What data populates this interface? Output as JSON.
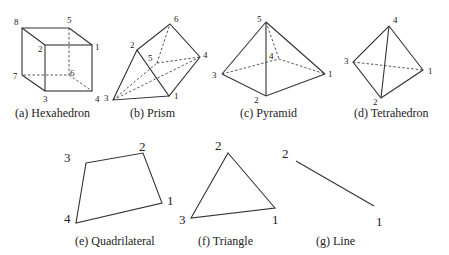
{
  "figures": [
    {
      "id": "hexahedron",
      "caption": "(a) Hexahedron",
      "node_labels": [
        "1",
        "2",
        "3",
        "4",
        "5",
        "6",
        "7",
        "8"
      ]
    },
    {
      "id": "prism",
      "caption": "(b) Prism",
      "node_labels": [
        "1",
        "2",
        "3",
        "4",
        "5",
        "6"
      ]
    },
    {
      "id": "pyramid",
      "caption": "(c) Pyramid",
      "node_labels": [
        "1",
        "2",
        "3",
        "4",
        "5"
      ]
    },
    {
      "id": "tetrahedron",
      "caption": "(d) Tetrahedron",
      "node_labels": [
        "1",
        "2",
        "3",
        "4"
      ]
    },
    {
      "id": "quadrilateral",
      "caption": "(e) Quadrilateral",
      "node_labels": [
        "1",
        "2",
        "3",
        "4"
      ]
    },
    {
      "id": "triangle",
      "caption": "(f) Triangle",
      "node_labels": [
        "1",
        "2",
        "3"
      ]
    },
    {
      "id": "line",
      "caption": "(g) Line",
      "node_labels": [
        "1",
        "2"
      ]
    }
  ]
}
